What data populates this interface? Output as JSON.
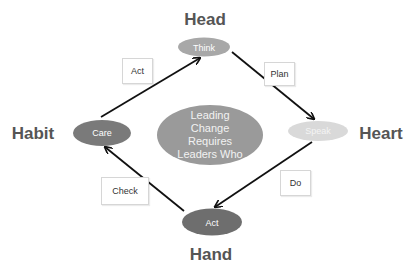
{
  "diagram": {
    "type": "cycle",
    "center": {
      "lines": [
        "Leading",
        "Change",
        "Requires",
        "Leaders Who"
      ],
      "color": "#9a9a9a"
    },
    "quadrant_labels": {
      "top": "Head",
      "right": "Heart",
      "bottom": "Hand",
      "left": "Habit"
    },
    "nodes": {
      "top": {
        "label": "Think",
        "color": "#a8a8a8"
      },
      "right": {
        "label": "Speak",
        "color": "#d9d9d9"
      },
      "bottom": {
        "label": "Act",
        "color": "#6e6e6e"
      },
      "left": {
        "label": "Care",
        "color": "#7a7a7a"
      }
    },
    "edges": [
      {
        "from": "Care",
        "to": "Think",
        "label": "Act"
      },
      {
        "from": "Think",
        "to": "Speak",
        "label": "Plan"
      },
      {
        "from": "Speak",
        "to": "Act",
        "label": "Do"
      },
      {
        "from": "Act",
        "to": "Care",
        "label": "Check"
      }
    ],
    "arrow_color": "#111111"
  }
}
